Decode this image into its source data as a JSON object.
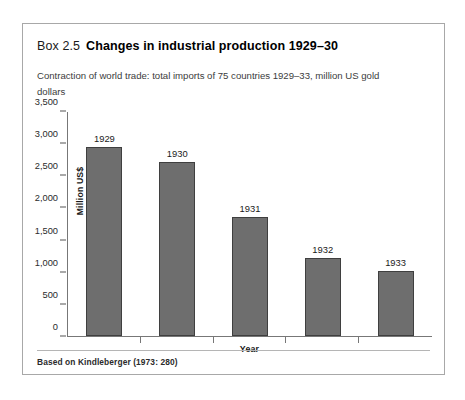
{
  "box": {
    "number": "Box 2.5",
    "title": "Changes in industrial production 1929–30",
    "subtitle": "Contraction of world trade: total imports of 75 countries 1929–33, million US gold dollars",
    "source_note": "Based on Kindleberger (1973: 280)",
    "border_color": "#a8a8a8"
  },
  "chart_data": {
    "type": "bar",
    "title": "Changes in industrial production 1929–30",
    "subtitle": "Contraction of world trade: total imports of 75 countries 1929–33, million US gold dollars",
    "categories": [
      "1929",
      "1930",
      "1931",
      "1932",
      "1933"
    ],
    "values": [
      2960,
      2720,
      1860,
      1220,
      1010
    ],
    "point_labels": [
      "1929",
      "1930",
      "1931",
      "1932",
      "1933"
    ],
    "xlabel": "Year",
    "ylabel": "Million US$",
    "ylim": [
      0,
      3500
    ],
    "ytick_values": [
      0,
      500,
      1000,
      1500,
      2000,
      2500,
      3000,
      3500
    ],
    "ytick_labels": [
      "0",
      "500",
      "1,000",
      "1,500",
      "2,000",
      "2,500",
      "3,000",
      "3,500"
    ],
    "grid": false,
    "legend": false,
    "bar_color": "#6e6e6e",
    "bar_edge_color": "#3f3f3f",
    "axis_color": "#777777"
  }
}
